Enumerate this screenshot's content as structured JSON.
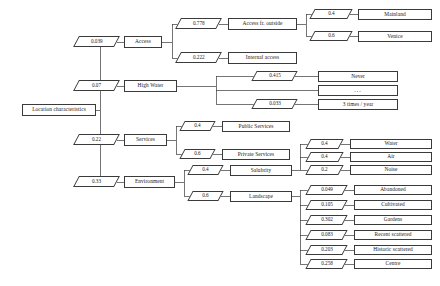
{
  "diagram": {
    "type": "hierarchical-value-tree",
    "root": {
      "label": "Location characteristics"
    },
    "criteria": [
      {
        "label": "Access",
        "weight": "0.039"
      },
      {
        "label": "High Water",
        "weight": "0.07"
      },
      {
        "label": "Services",
        "weight": "0.22"
      },
      {
        "label": "Environment",
        "weight": "0.33"
      }
    ],
    "access": {
      "children": [
        {
          "label": "Access fr. outside",
          "weight": "0.778"
        },
        {
          "label": "Internal access",
          "weight": "0.222"
        }
      ],
      "outside_children": [
        {
          "label": "Mainland",
          "weight": "0.4"
        },
        {
          "label": "Venice",
          "weight": "0.6"
        }
      ]
    },
    "high_water": {
      "children": [
        {
          "label": "Never",
          "weight": "0.415"
        },
        {
          "label": "...",
          "weight": ""
        },
        {
          "label": "3 times / year",
          "weight": "0.033"
        }
      ]
    },
    "services": {
      "children": [
        {
          "label": "Public Services",
          "weight": "0.4"
        },
        {
          "label": "Private Services",
          "weight": "0.6"
        }
      ]
    },
    "environment": {
      "children": [
        {
          "label": "Salubrity",
          "weight": "0.4"
        },
        {
          "label": "Landscape",
          "weight": "0.6"
        }
      ],
      "salubrity_children": [
        {
          "label": "Water",
          "weight": "0.4"
        },
        {
          "label": "Air",
          "weight": "0.4"
        },
        {
          "label": "Noise",
          "weight": "0.2"
        }
      ],
      "landscape_children": [
        {
          "label": "Abandoned",
          "weight": "0.049"
        },
        {
          "label": "Cultivated",
          "weight": "0.105"
        },
        {
          "label": "Gardens",
          "weight": "0.302"
        },
        {
          "label": "Recent scattered",
          "weight": "0.083"
        },
        {
          "label": "Historic scattered",
          "weight": "0.203"
        },
        {
          "label": "Centre",
          "weight": "0.258"
        }
      ]
    },
    "style": {
      "line_color": "#3a3a3a",
      "text_color": "#1a1a1a",
      "background": "#ffffff"
    }
  }
}
